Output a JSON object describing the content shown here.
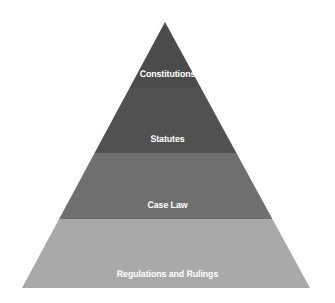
{
  "diagram": {
    "kind": "pyramid-hierarchy",
    "background_color": "#ffffff",
    "canvas": {
      "width": 335,
      "height": 303
    },
    "geometry": {
      "apex_x": 165,
      "apex_y": 22,
      "base_left_x": 22,
      "base_right_x": 310,
      "base_y": 288,
      "band_boundaries_y": [
        22,
        88,
        153,
        219,
        288
      ]
    },
    "label_color": "#ffffff",
    "tiers": [
      {
        "label": "Constitutions",
        "color": "#4b4b4b",
        "rank": 1,
        "band_top_y": 22,
        "band_bottom_y": 88
      },
      {
        "label": "Statutes",
        "color": "#515151",
        "rank": 2,
        "band_top_y": 88,
        "band_bottom_y": 153
      },
      {
        "label": "Case Law",
        "color": "#6f6f6f",
        "rank": 3,
        "band_top_y": 153,
        "band_bottom_y": 219
      },
      {
        "label": "Regulations and Rulings",
        "color": "#a9a9a9",
        "rank": 4,
        "band_top_y": 219,
        "band_bottom_y": 288
      }
    ]
  }
}
